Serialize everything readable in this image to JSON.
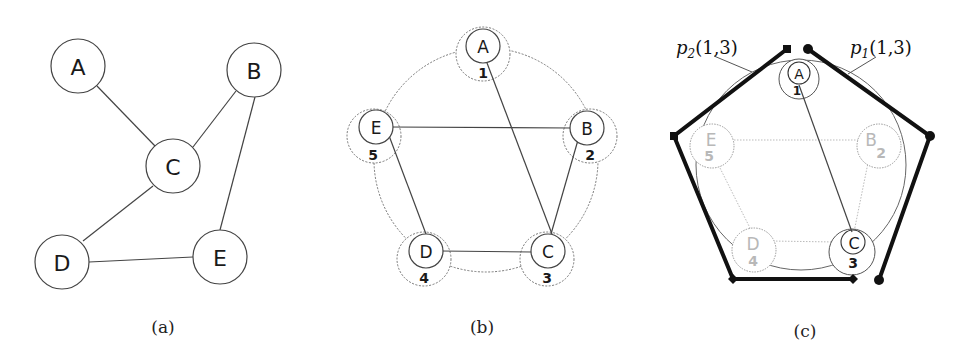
{
  "figure": {
    "panels": [
      {
        "id": "a",
        "caption": "(a)",
        "description": "Original graph",
        "nodes": [
          {
            "label": "A",
            "x": 78,
            "y": 66
          },
          {
            "label": "B",
            "x": 254,
            "y": 70
          },
          {
            "label": "C",
            "x": 173,
            "y": 166
          },
          {
            "label": "D",
            "x": 62,
            "y": 262
          },
          {
            "label": "E",
            "x": 220,
            "y": 257
          }
        ],
        "edges": [
          [
            "A",
            "C"
          ],
          [
            "B",
            "C"
          ],
          [
            "B",
            "E"
          ],
          [
            "C",
            "D"
          ],
          [
            "D",
            "E"
          ]
        ]
      },
      {
        "id": "b",
        "caption": "(b)",
        "description": "Nodes placed on a circle with ordering numbers",
        "nodes": [
          {
            "label": "A",
            "order": "1",
            "x": 483,
            "y": 46
          },
          {
            "label": "B",
            "order": "2",
            "x": 587,
            "y": 128
          },
          {
            "label": "C",
            "order": "3",
            "x": 548,
            "y": 251
          },
          {
            "label": "D",
            "order": "4",
            "x": 426,
            "y": 251
          },
          {
            "label": "E",
            "order": "5",
            "x": 388,
            "y": 128
          }
        ],
        "edges": [
          [
            "A",
            "C"
          ],
          [
            "E",
            "B"
          ],
          [
            "B",
            "C"
          ],
          [
            "E",
            "D"
          ],
          [
            "D",
            "C"
          ]
        ]
      },
      {
        "id": "c",
        "caption": "(c)",
        "description": "Two candidate routing paths between node 1 and node 3",
        "nodes": [
          {
            "label": "A",
            "order": "1",
            "x": 799,
            "y": 73,
            "highlighted": true
          },
          {
            "label": "B",
            "order": "2",
            "x": 878,
            "y": 140,
            "highlighted": false
          },
          {
            "label": "C",
            "order": "3",
            "x": 852,
            "y": 249,
            "highlighted": true
          },
          {
            "label": "D",
            "order": "4",
            "x": 754,
            "y": 248,
            "highlighted": false
          },
          {
            "label": "E",
            "order": "5",
            "x": 712,
            "y": 140,
            "highlighted": false
          }
        ],
        "edges": [
          [
            "A",
            "C"
          ]
        ],
        "faded_edges": [
          [
            "E",
            "B"
          ],
          [
            "B",
            "C"
          ],
          [
            "E",
            "D"
          ],
          [
            "D",
            "C"
          ]
        ],
        "paths": [
          {
            "name": "p",
            "sub": "2",
            "args": "(1,3)",
            "label": "p2(1,3)",
            "direction": "counter-clockwise"
          },
          {
            "name": "p",
            "sub": "1",
            "args": "(1,3)",
            "label": "p1(1,3)",
            "direction": "clockwise"
          }
        ]
      }
    ],
    "colors": {
      "stroke": "#333333",
      "faded": "#b0b0b0",
      "path": "#111111",
      "background": "#ffffff"
    }
  }
}
